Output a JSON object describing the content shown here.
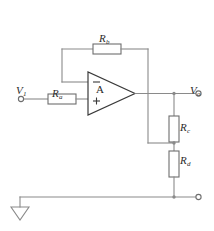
{
  "diagram": {
    "colors": {
      "wire": "#8a8a8a",
      "component_outline": "#6e6e6e",
      "opamp_outline": "#3a3a3a",
      "text": "#2b2b2b",
      "background": "#ffffff"
    }
  },
  "labels": {
    "input_source": {
      "symbol": "V",
      "subscript": "1"
    },
    "output_node": {
      "symbol": "V",
      "subscript": "o"
    },
    "resistor_a": {
      "symbol": "R",
      "subscript": "a"
    },
    "resistor_b": {
      "symbol": "R",
      "subscript": "b"
    },
    "resistor_c": {
      "symbol": "R",
      "subscript": "c"
    },
    "resistor_d": {
      "symbol": "R",
      "subscript": "d"
    },
    "opamp": "A",
    "inverting_input": "−",
    "noninverting_input": "+"
  },
  "components": [
    {
      "name": "resistor-a",
      "type": "resistor",
      "orientation": "horizontal",
      "label": "Ra"
    },
    {
      "name": "resistor-b",
      "type": "resistor",
      "orientation": "horizontal",
      "label": "Rb"
    },
    {
      "name": "resistor-c",
      "type": "resistor",
      "orientation": "vertical",
      "label": "Rc"
    },
    {
      "name": "resistor-d",
      "type": "resistor",
      "orientation": "vertical",
      "label": "Rd"
    },
    {
      "name": "opamp",
      "type": "operational-amplifier",
      "label": "A"
    },
    {
      "name": "ground",
      "type": "ground-symbol",
      "label": ""
    }
  ],
  "terminals": [
    {
      "name": "input-terminal",
      "label": "V1"
    },
    {
      "name": "output-terminal",
      "label": "Vo"
    },
    {
      "name": "reference-terminal",
      "label": ""
    }
  ]
}
